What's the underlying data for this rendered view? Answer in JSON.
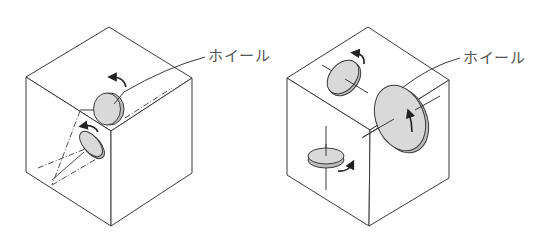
{
  "figures": [
    {
      "id": "three-axis-single-skew",
      "label": "ホイール",
      "description": "Cube with two reaction wheels mounted on skewed axes (dashed axis lines)"
    },
    {
      "id": "three-axis-orthogonal",
      "label": "ホイール",
      "description": "Cube with three reaction wheels on orthogonal axes"
    }
  ],
  "colors": {
    "line": "#3a3a3a",
    "wheel_fill": "#d9d9d9",
    "label": "#555555",
    "background": "#ffffff"
  }
}
